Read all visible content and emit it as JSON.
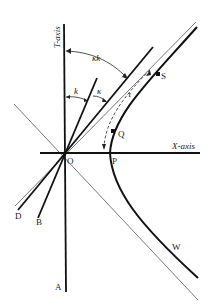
{
  "figure": {
    "axes": {
      "x_label": "X-axis",
      "t_label": "T-axis"
    },
    "points": {
      "origin": "O",
      "vertex": "P",
      "q": "Q",
      "s": "S",
      "w": "W",
      "a": "A",
      "b": "B",
      "d": "D"
    },
    "angle_labels": {
      "k": "k",
      "kappa": "κ",
      "kappa_k": "κk",
      "tau": "τ"
    },
    "colors": {
      "ink": "#111111",
      "thin_line": "#555555",
      "background": "#ffffff"
    }
  }
}
